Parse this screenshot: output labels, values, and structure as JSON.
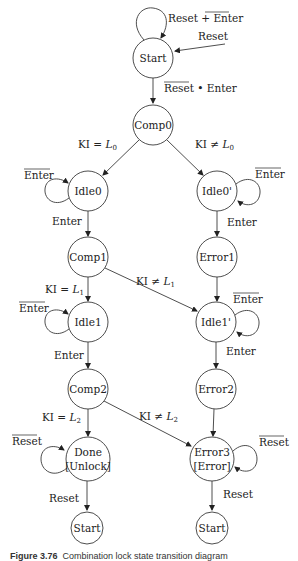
{
  "nodes": {
    "start_top": {
      "label": "Start"
    },
    "comp0": {
      "label": "Comp0"
    },
    "idle0": {
      "label": "Idle0"
    },
    "idle0p": {
      "label": "Idle0'"
    },
    "comp1": {
      "label": "Comp1"
    },
    "error1": {
      "label": "Error1"
    },
    "idle1": {
      "label": "Idle1"
    },
    "idle1p": {
      "label": "Idle1'"
    },
    "comp2": {
      "label": "Comp2"
    },
    "error2": {
      "label": "Error2"
    },
    "done": {
      "label_line1": "Done",
      "label_line2": "[Unlock]"
    },
    "error3": {
      "label_line1": "Error3",
      "label_line2": "[Error]"
    },
    "start_left": {
      "label": "Start"
    },
    "start_right": {
      "label": "Start"
    }
  },
  "edges": {
    "start_self": {
      "part1": "Reset + ",
      "part2_overlined": "Enter"
    },
    "reset_in": {
      "label": "Reset"
    },
    "start_to_comp0": {
      "part1_overlined": "Reset",
      "part2": " • Enter"
    },
    "comp0_to_idle0": {
      "prefix": "KI = ",
      "var": "L",
      "sub": "0"
    },
    "comp0_to_idle0p": {
      "prefix": "KI ≠ ",
      "var": "L",
      "sub": "0"
    },
    "idle0_self": {
      "overlined": "Enter"
    },
    "idle0p_self": {
      "overlined": "Enter"
    },
    "idle0_to_comp1": {
      "label": "Enter"
    },
    "idle0p_to_error1": {
      "label": "Enter"
    },
    "comp1_to_idle1": {
      "prefix": "KI = ",
      "var": "L",
      "sub": "1"
    },
    "comp1_to_idle1p": {
      "prefix": "KI ≠ ",
      "var": "L",
      "sub": "1"
    },
    "idle1_self": {
      "overlined": "Enter"
    },
    "idle1p_self": {
      "overlined": "Enter"
    },
    "idle1_to_comp2": {
      "label": "Enter"
    },
    "idle1p_to_error2": {
      "label": "Enter"
    },
    "comp2_to_done": {
      "prefix": "KI = ",
      "var": "L",
      "sub": "2"
    },
    "comp2_to_error3": {
      "prefix": "KI ≠ ",
      "var": "L",
      "sub": "2"
    },
    "done_self": {
      "overlined": "Reset"
    },
    "error3_self": {
      "overlined": "Reset"
    },
    "done_to_start": {
      "label": "Reset"
    },
    "error3_to_start": {
      "label": "Reset"
    }
  },
  "caption": {
    "figure_number": "Figure 3.76",
    "text": "Combination lock state transition diagram"
  }
}
